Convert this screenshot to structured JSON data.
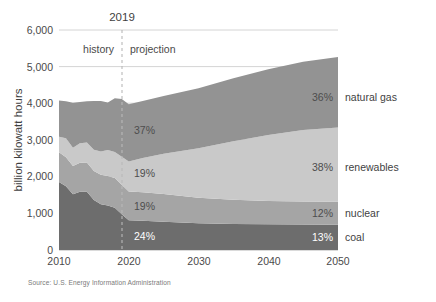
{
  "chart_data": {
    "type": "area",
    "stacking": "stacked",
    "title": "",
    "subtitle": "",
    "xlabel": "",
    "ylabel": "billion kilowatt hours",
    "xlim": [
      2010,
      2050
    ],
    "ylim": [
      0,
      6000
    ],
    "grid": true,
    "legend_position": "right-inline",
    "source": "Source: U.S. Energy Information Administration",
    "xticks": [
      "2010",
      "2020",
      "2030",
      "2040",
      "2050"
    ],
    "xtick_values": [
      2010,
      2020,
      2030,
      2040,
      2050
    ],
    "yticks": [
      "0",
      "1,000",
      "2,000",
      "3,000",
      "4,000",
      "5,000",
      "6,000"
    ],
    "ytick_values": [
      0,
      1000,
      2000,
      3000,
      4000,
      5000,
      6000
    ],
    "annotations": {
      "divider_year_label": "2019",
      "divider_year_value": 2019,
      "left_region_label": "history",
      "right_region_label": "projection"
    },
    "x": [
      2010,
      2011,
      2012,
      2013,
      2014,
      2015,
      2016,
      2017,
      2018,
      2019,
      2020,
      2022,
      2025,
      2030,
      2035,
      2040,
      2045,
      2050
    ],
    "series": [
      {
        "name": "coal",
        "legend_label": "coal",
        "end_share_label": "13%",
        "start_share_label": "24%",
        "color": "#6d6d6d",
        "values": [
          1850,
          1733,
          1514,
          1581,
          1582,
          1352,
          1239,
          1206,
          1146,
          966,
          800,
          790,
          760,
          720,
          700,
          690,
          685,
          680
        ]
      },
      {
        "name": "nuclear",
        "legend_label": "nuclear",
        "end_share_label": "12%",
        "start_share_label": "19%",
        "color": "#a5a5a5",
        "values": [
          807,
          790,
          769,
          789,
          797,
          797,
          806,
          805,
          807,
          809,
          790,
          780,
          760,
          700,
          660,
          640,
          630,
          625
        ]
      },
      {
        "name": "renewables",
        "legend_label": "renewables",
        "end_share_label": "38%",
        "start_share_label": "19%",
        "color": "#c9c9c9",
        "values": [
          427,
          520,
          503,
          536,
          547,
          577,
          635,
          713,
          713,
          760,
          820,
          930,
          1100,
          1350,
          1600,
          1800,
          1950,
          2030
        ]
      },
      {
        "name": "natural gas",
        "legend_label": "natural gas",
        "end_share_label": "36%",
        "start_share_label": "37%",
        "color": "#939393",
        "values": [
          988,
          1013,
          1225,
          1125,
          1126,
          1333,
          1380,
          1297,
          1468,
          1582,
          1560,
          1560,
          1580,
          1640,
          1720,
          1800,
          1870,
          1930
        ]
      }
    ]
  },
  "labels": {
    "inner_pct": [
      {
        "series": "natural gas",
        "text": "37%"
      },
      {
        "series": "renewables",
        "text": "19%"
      },
      {
        "series": "nuclear",
        "text": "19%"
      },
      {
        "series": "coal",
        "text": "24%"
      }
    ],
    "right_pct": [
      {
        "series": "natural gas",
        "text": "36%",
        "name": "natural gas"
      },
      {
        "series": "renewables",
        "text": "38%",
        "name": "renewables"
      },
      {
        "series": "nuclear",
        "text": "12%",
        "name": "nuclear"
      },
      {
        "series": "coal",
        "text": "13%",
        "name": "coal"
      }
    ]
  }
}
